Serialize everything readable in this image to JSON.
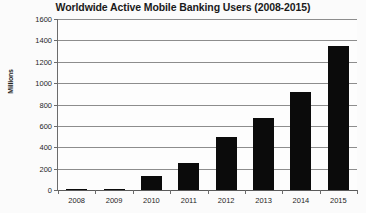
{
  "chart_data": {
    "type": "bar",
    "title": "Worldwide Active Mobile Banking Users (2008-2015)",
    "xlabel": "",
    "ylabel": "Millions",
    "categories": [
      "2008",
      "2009",
      "2010",
      "2011",
      "2012",
      "2013",
      "2014",
      "2015"
    ],
    "values": [
      2,
      5,
      130,
      255,
      500,
      670,
      920,
      1350
    ],
    "ylim": [
      0,
      1600
    ],
    "ytick_labels": [
      "0",
      "200",
      "400",
      "600",
      "800",
      "1000",
      "1200",
      "1400",
      "1600"
    ],
    "ytick_values": [
      0,
      200,
      400,
      600,
      800,
      1000,
      1200,
      1400,
      1600
    ],
    "grid": true,
    "legend": false,
    "bar_color": "#0b0b0b",
    "grid_color": "#8d8d8d",
    "background_color": "#fbfbfb"
  }
}
